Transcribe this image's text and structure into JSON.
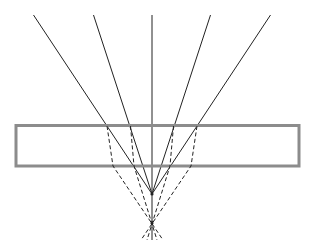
{
  "diagram": {
    "type": "optics-ray-diagram",
    "colors": {
      "ray": "#222222",
      "slab_border": "#8c8c8c",
      "background": "#ffffff"
    },
    "slab": {
      "x": 16,
      "y": 125.5,
      "width": 283,
      "height": 40.5
    },
    "incident_rays": [
      {
        "x1": 33.5,
        "y1": 15,
        "x2": 152,
        "y2": 194
      },
      {
        "x1": 93.5,
        "y1": 15,
        "x2": 152,
        "y2": 194
      },
      {
        "x1": 152,
        "y1": 15,
        "x2": 152,
        "y2": 240
      },
      {
        "x1": 210.5,
        "y1": 15,
        "x2": 152,
        "y2": 194
      },
      {
        "x1": 270.5,
        "y1": 15,
        "x2": 152,
        "y2": 194
      }
    ],
    "refracted_rays": [
      {
        "points": "107,126 113,166 163,240"
      },
      {
        "points": "130.5,126 134,166 157,240"
      },
      {
        "points": "173.5,126 170,166 147,240"
      },
      {
        "points": "197,126 191,166 141,240"
      }
    ],
    "original_focus": {
      "x": 152,
      "y": 194
    },
    "shifted_focus": {
      "x": 152,
      "y": 223
    }
  }
}
